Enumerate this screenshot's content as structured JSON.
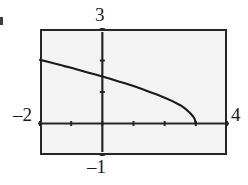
{
  "figure": {
    "kind": "graphing-calculator-plot",
    "background_color": "#ffffff",
    "plot_background_color": "#f3f3f3",
    "frame_color": "#262626",
    "curve_color": "#1a1a1a"
  },
  "labels": {
    "y_max": "3",
    "y_min": "–1",
    "x_min": "–2",
    "x_max": "4"
  },
  "chart_data": {
    "type": "line",
    "title": "",
    "xlabel": "",
    "ylabel": "",
    "xlim": [
      -2,
      4
    ],
    "ylim": [
      -1,
      3
    ],
    "grid": false,
    "legend": null,
    "axes": {
      "x_axis_drawn": true,
      "y_axis_drawn": true,
      "x_tick_values": [
        -2,
        -1,
        0,
        1,
        2,
        3,
        4
      ],
      "y_tick_values": [
        -1,
        0,
        1,
        2,
        3
      ],
      "tick_style": "short-marks-no-numeric-labels",
      "corner_labels": {
        "top": "3",
        "bottom": "–1",
        "left": "–2",
        "right": "4"
      }
    },
    "series": [
      {
        "name": "curve",
        "style": "solid",
        "x": [
          -2.0,
          -1.75,
          -1.5,
          -1.25,
          -1.0,
          -0.75,
          -0.5,
          -0.25,
          0.0,
          0.25,
          0.5,
          0.75,
          1.0,
          1.25,
          1.5,
          1.75,
          2.0,
          2.25,
          2.5,
          2.65,
          2.8,
          2.9,
          2.96,
          3.0
        ],
        "y": [
          2.02,
          1.96,
          1.9,
          1.83,
          1.77,
          1.7,
          1.63,
          1.56,
          1.49,
          1.42,
          1.34,
          1.27,
          1.19,
          1.1,
          1.01,
          0.92,
          0.82,
          0.71,
          0.58,
          0.48,
          0.35,
          0.24,
          0.15,
          0.0
        ],
        "endpoint_x": 3.0,
        "endpoint_y": 0.0,
        "note": "decreasing curve falling steeply to the x-axis at x = 3"
      }
    ]
  }
}
